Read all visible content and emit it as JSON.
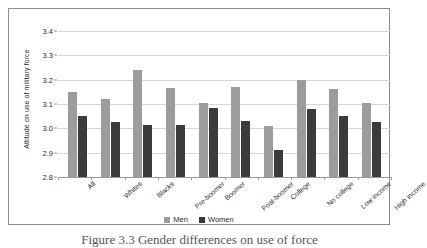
{
  "chart_data": {
    "type": "bar",
    "title": "",
    "xlabel": "",
    "ylabel": "Attitude on use of military force",
    "ylim": [
      2.8,
      3.4
    ],
    "ytick_labels": [
      "3.4",
      "3.3",
      "3.2",
      "3.1",
      "3.0",
      "2.9",
      "2.8"
    ],
    "ytick_values": [
      3.4,
      3.3,
      3.2,
      3.1,
      3.0,
      2.9,
      2.8
    ],
    "grid": true,
    "legend_position": "bottom",
    "categories": [
      "All",
      "Whites",
      "Blacks",
      "Pre-boomer",
      "Boomer",
      "Post-boomer",
      "College",
      "No college",
      "Low income",
      "High income"
    ],
    "series": [
      {
        "name": "Men",
        "color": "#9c9c9c",
        "values": [
          3.15,
          3.12,
          3.24,
          3.165,
          3.105,
          3.17,
          3.01,
          3.2,
          3.16,
          3.105
        ]
      },
      {
        "name": "Women",
        "color": "#3b3b3b",
        "values": [
          3.05,
          3.025,
          3.015,
          3.015,
          3.085,
          3.03,
          2.91,
          3.08,
          3.05,
          3.025
        ]
      }
    ]
  },
  "legend": {
    "items": [
      {
        "label": "Men"
      },
      {
        "label": "Women"
      }
    ]
  },
  "caption": {
    "text": "Figure 3.3 Gender differences on use of force"
  },
  "colors": {
    "men": "#9c9c9c",
    "women": "#3b3b3b",
    "grid": "#d6d6d6",
    "axis": "#9a9a9a",
    "frame": "#8d8d8d",
    "text": "#2b2b2b"
  }
}
